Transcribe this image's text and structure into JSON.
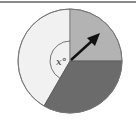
{
  "diagram": {
    "type": "spinner",
    "center": [
      70,
      61
    ],
    "radius": 52,
    "sectors": [
      {
        "name": "light",
        "color": "#f1f1f1",
        "start_deg": 90,
        "end_deg": 240
      },
      {
        "name": "medium",
        "color": "#b3b3b3",
        "start_deg": 0,
        "end_deg": 90
      },
      {
        "name": "dark",
        "color": "#6b6b6b",
        "start_deg": 240,
        "end_deg": 360
      }
    ],
    "angle_label": "x°",
    "arrow": {
      "color": "#111111",
      "direction_deg": 43
    }
  }
}
